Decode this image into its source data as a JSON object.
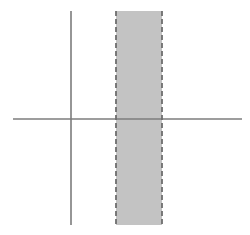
{
  "figure": {
    "canvas": {
      "width": 250,
      "height": 235,
      "background": "#ffffff"
    }
  },
  "chart_data": {
    "type": "scatter",
    "title": "",
    "subtitle": "",
    "xlabel": "",
    "ylabel": "",
    "grid": false,
    "legend": null,
    "axes": {
      "origin_px": {
        "x": 71,
        "y": 119
      },
      "x_axis": {
        "name": "horizontal-axis",
        "y_px": 119,
        "x_start_px": 13,
        "x_end_px": 242,
        "color": "#7c7c7c",
        "width_px": 1.6,
        "ticks": [],
        "tick_labels": [],
        "arrowheads": false
      },
      "y_axis": {
        "name": "vertical-axis",
        "x_px": 71,
        "y_start_px": 11,
        "y_end_px": 225,
        "color": "#7c7c7c",
        "width_px": 1.6,
        "ticks": [],
        "tick_labels": [],
        "arrowheads": false
      }
    },
    "shaded_regions": [
      {
        "name": "vertical-strip",
        "orientation": "vertical",
        "x_start_px": 116,
        "x_end_px": 162,
        "y_start_px": 11,
        "y_end_px": 225,
        "width_px": 46,
        "height_px": 214,
        "fill": "#c3c3c3",
        "fill_opacity": 1,
        "border_style": "dashed",
        "border_color": "#6e6e6e",
        "border_width_px": 1.8,
        "border_dash": [
          5,
          3
        ],
        "bordered_sides": [
          "left",
          "right"
        ],
        "label": ""
      }
    ],
    "annotations": [],
    "data_points": [],
    "series": []
  },
  "colors": {
    "background": "#ffffff",
    "axis": "#7c7c7c",
    "band_fill": "#c3c3c3",
    "band_border": "#6e6e6e"
  }
}
